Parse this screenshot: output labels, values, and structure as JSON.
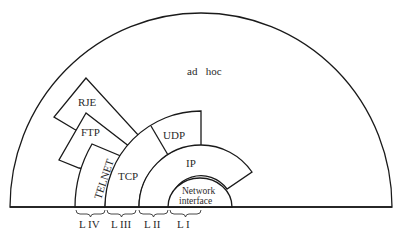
{
  "diagram": {
    "title": "",
    "regions": {
      "ad_hoc": "ad   hoc",
      "rje": "RJE",
      "ftp": "FTP",
      "telnet": "TELNET",
      "tcp": "TCP",
      "udp": "UDP",
      "ip": "IP",
      "network_interface_line1": "Network",
      "network_interface_line2": "interface"
    },
    "layers": [
      {
        "label": "L IV",
        "members": [
          "TELNET",
          "FTP",
          "RJE"
        ]
      },
      {
        "label": "L III",
        "members": [
          "TCP",
          "UDP"
        ]
      },
      {
        "label": "L II",
        "members": [
          "IP"
        ]
      },
      {
        "label": "L I",
        "members": [
          "Network interface"
        ]
      }
    ],
    "colors": {
      "stroke": "#1a1a1a",
      "fill": "#ffffff",
      "text": "#2a2a2a"
    }
  }
}
